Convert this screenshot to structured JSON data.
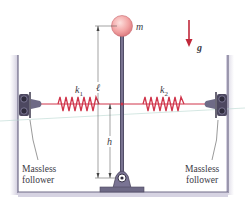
{
  "figure": {
    "mass_label": "m",
    "gravity_label": "g",
    "spring_left_label": "k",
    "spring_left_sub": "1",
    "spring_right_label": "k",
    "spring_right_sub": "2",
    "length_label": "ℓ",
    "height_label": "h",
    "follower_left": {
      "line1": "Massless",
      "line2": "follower"
    },
    "follower_right": {
      "line1": "Massless",
      "line2": "follower"
    }
  },
  "colors": {
    "spring": "#d0344a",
    "gravity_arrow": "#c0283a",
    "mass_ball": "#f2a3a3",
    "rod": "#5a5570",
    "frame": "#6e6a86",
    "hardware": "#4d4860"
  }
}
